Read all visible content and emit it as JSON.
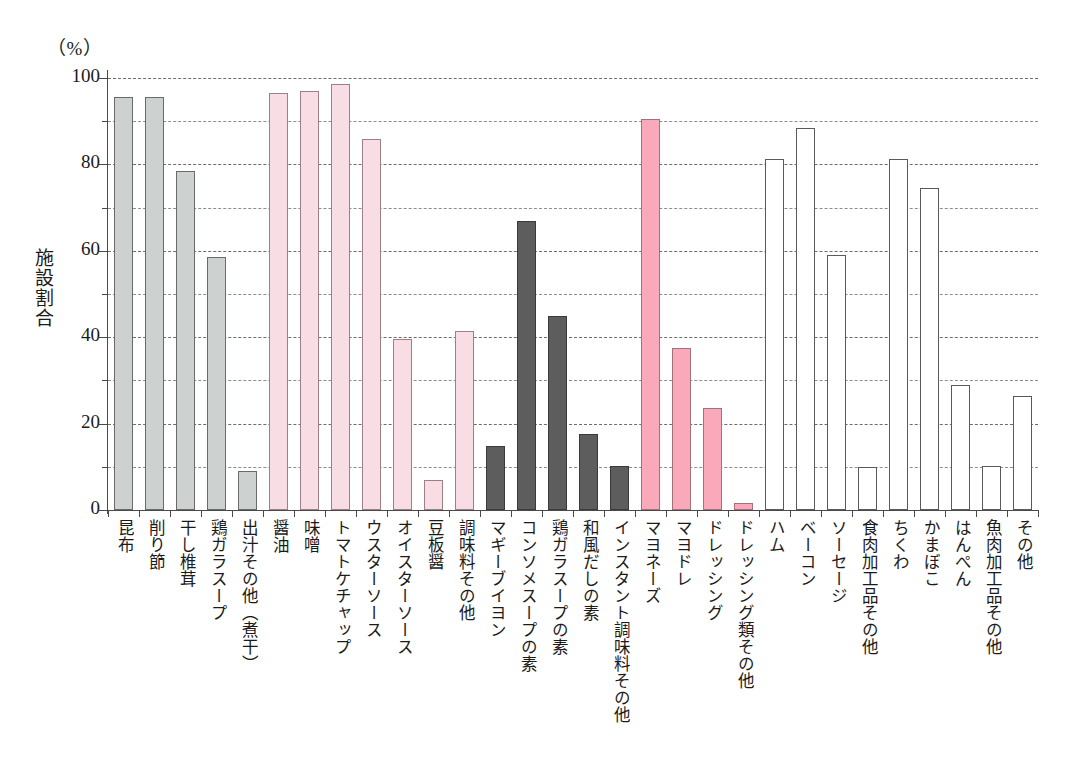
{
  "chart_data": {
    "type": "bar",
    "title": "",
    "subtitle": "",
    "unit_label": "（%）",
    "xlabel": "",
    "ylabel": "施設割合",
    "ylim": [
      0,
      100
    ],
    "grid": true,
    "legend": "none",
    "y_ticks_major": [
      0,
      20,
      40,
      60,
      80,
      100
    ],
    "y_ticks_minor": [
      10,
      30,
      50,
      70,
      90
    ],
    "y_tick_labels": [
      "0",
      "20",
      "40",
      "60",
      "80",
      "100"
    ],
    "categories": [
      "昆布",
      "削り節",
      "干し椎茸",
      "鶏ガラスープ",
      "出汁その他（煮干）",
      "醤油",
      "味噌",
      "トマトケチャップ",
      "ウスターソース",
      "オイスターソース",
      "豆板醤",
      "調味料その他",
      "マギーブイヨン",
      "コンソメスープの素",
      "鶏ガラスープの素",
      "和風だしの素",
      "インスタント調味料その他",
      "マヨネーズ",
      "マヨドレ",
      "ドレッシング",
      "ドレッシング類その他",
      "ハム",
      "ベーコン",
      "ソーセージ",
      "食肉加工品その他",
      "ちくわ",
      "かまぼこ",
      "はんぺん",
      "魚肉加工品その他",
      "その他"
    ],
    "values": [
      95.5,
      95.5,
      78.5,
      58.5,
      9.0,
      96.5,
      97.0,
      98.5,
      85.8,
      39.5,
      7.0,
      41.5,
      14.8,
      67.0,
      45.0,
      17.5,
      10.3,
      90.5,
      37.5,
      23.7,
      1.7,
      81.2,
      88.5,
      59.0,
      10.0,
      81.2,
      74.5,
      29.0,
      10.3,
      26.3
    ],
    "bar_styles": [
      "gray-light",
      "gray-light",
      "gray-light",
      "gray-light",
      "gray-light",
      "pink-light",
      "pink-light",
      "pink-light",
      "pink-light",
      "pink-light",
      "pink-light",
      "pink-light",
      "gray-dark",
      "gray-dark",
      "gray-dark",
      "gray-dark",
      "gray-dark",
      "pink-mid",
      "pink-mid",
      "pink-mid",
      "pink-mid",
      "white",
      "white",
      "white",
      "white",
      "white",
      "white",
      "white",
      "white",
      "white"
    ],
    "colors": {
      "gray_light": "#cdd1d0",
      "gray_dark": "#5d5d5d",
      "pink_light": "#f9dde4",
      "pink_mid": "#f9a9b9",
      "white": "#ffffff",
      "axis": "#4a4a4a",
      "gridline": "#6d6d6d"
    }
  }
}
